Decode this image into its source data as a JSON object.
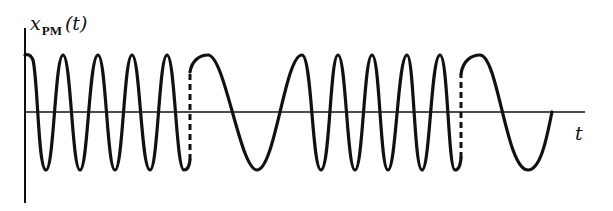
{
  "diagram": {
    "title": "",
    "y_axis_label": {
      "symbol": "x",
      "subscript": "PM",
      "argument": "(t)"
    },
    "x_axis_label": "t",
    "segments": [
      {
        "type": "fast",
        "from_x": 25,
        "to_x": 190,
        "peaks": 5
      },
      {
        "type": "phase-jump",
        "x": 190,
        "style": "dashed"
      },
      {
        "type": "slow",
        "from_x": 190,
        "to_x": 320,
        "peaks": 2
      },
      {
        "type": "fast",
        "from_x": 320,
        "to_x": 461,
        "peaks": 4
      },
      {
        "type": "phase-jump",
        "x": 461,
        "style": "dashed"
      },
      {
        "type": "slow",
        "from_x": 461,
        "to_x": 552,
        "peaks": 1
      }
    ],
    "colors": {
      "line": "#111111",
      "background": "#ffffff"
    }
  }
}
